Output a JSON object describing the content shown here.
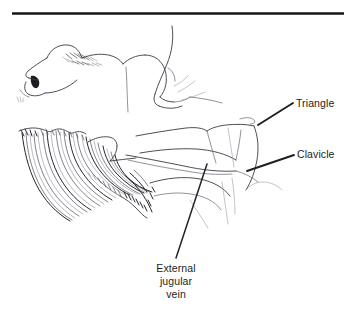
{
  "figure": {
    "background_color": "#ffffff",
    "ink_color": "#1d1d22",
    "width": 354,
    "height": 319
  },
  "divider": {
    "name": "top-rule",
    "color": "#16161a",
    "thickness": 2.6
  },
  "labels": [
    {
      "id": "triangle",
      "text": "Triangle",
      "lines": [
        "Triangle"
      ],
      "align": "left",
      "leader": {
        "from_x": 258,
        "from_y": 125,
        "to_x": 293,
        "to_y": 103
      }
    },
    {
      "id": "clavicle",
      "text": "Clavicle",
      "lines": [
        "Clavicle"
      ],
      "align": "left",
      "leader": {
        "from_x": 247,
        "from_y": 171,
        "to_x": 294,
        "to_y": 155
      }
    },
    {
      "id": "external-jugular-vein",
      "text": "External jugular vein",
      "lines": [
        "External",
        "jugular",
        "vein"
      ],
      "align": "center",
      "leader": {
        "from_x": 207,
        "from_y": 164,
        "to_x": 176,
        "to_y": 258
      }
    }
  ],
  "structures": [
    {
      "name": "head-profile",
      "description": "lateral view of head, chin and nose at left"
    },
    {
      "name": "neck-contour",
      "description": "jaw line sweeping into neck"
    },
    {
      "name": "shoulder-contour",
      "description": "deltoid and shoulder slope at right"
    },
    {
      "name": "clavicle-bone",
      "description": "collar bone running left to right"
    },
    {
      "name": "supraclavicular-triangle",
      "description": "triangular fossa above the clavicle"
    },
    {
      "name": "hair-mass",
      "description": "dense curved hatching fan at lower left"
    }
  ]
}
